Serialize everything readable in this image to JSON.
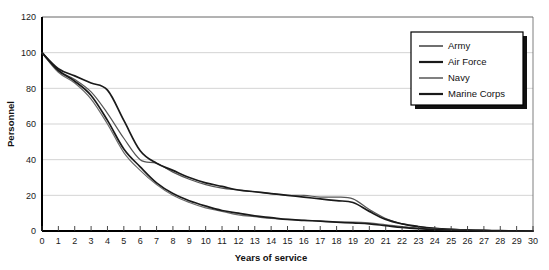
{
  "chart_data": {
    "type": "line",
    "title": "",
    "xlabel": "Years of service",
    "ylabel": "Personnel",
    "xlim": [
      0,
      30
    ],
    "ylim": [
      0,
      120
    ],
    "ytick_step": 20,
    "yticks": [
      0,
      20,
      40,
      60,
      80,
      100,
      120
    ],
    "xticks": [
      0,
      1,
      2,
      3,
      4,
      5,
      6,
      7,
      8,
      9,
      10,
      11,
      12,
      13,
      14,
      15,
      16,
      17,
      18,
      19,
      20,
      21,
      22,
      23,
      24,
      25,
      26,
      27,
      28,
      29,
      30
    ],
    "grid": true,
    "legend_position": "top-right",
    "x": [
      0,
      1,
      2,
      3,
      4,
      5,
      6,
      7,
      8,
      9,
      10,
      11,
      12,
      13,
      14,
      15,
      16,
      17,
      18,
      19,
      20,
      21,
      22,
      23,
      24,
      25,
      26,
      27,
      28,
      29,
      30
    ],
    "series": [
      {
        "name": "Army",
        "color": "#555555",
        "width": 1.2,
        "values": [
          100,
          90,
          85,
          78,
          66,
          52,
          40,
          38,
          33,
          29,
          26,
          24,
          23,
          22,
          21,
          20,
          20,
          19,
          19,
          18,
          12,
          7,
          4,
          2.5,
          1.5,
          1,
          0.6,
          0.4,
          0.2,
          0.1,
          0
        ]
      },
      {
        "name": "Air Force",
        "color": "#1a1a1a",
        "width": 1.7,
        "values": [
          100,
          91,
          87,
          83,
          79,
          62,
          45,
          38,
          34,
          30,
          27,
          25,
          23,
          22,
          21,
          20,
          19,
          18,
          17,
          16,
          11,
          6.5,
          4,
          2.5,
          1.5,
          0.9,
          0.5,
          0.3,
          0.2,
          0.1,
          0
        ]
      },
      {
        "name": "Navy",
        "color": "#6a6a6a",
        "width": 1.2,
        "values": [
          100,
          89,
          83,
          74,
          60,
          44,
          34,
          26,
          20,
          16,
          13,
          11,
          9,
          8,
          7,
          6.5,
          6,
          5.5,
          5,
          5,
          4.5,
          3.5,
          2.5,
          1.6,
          1,
          0.6,
          0.4,
          0.2,
          0.1,
          0.05,
          0
        ]
      },
      {
        "name": "Marine Corps",
        "color": "#1a1a1a",
        "width": 1.7,
        "values": [
          100,
          90,
          84,
          76,
          62,
          46,
          36,
          27,
          21,
          17,
          14,
          11.5,
          10,
          8.5,
          7.5,
          6.5,
          6,
          5.5,
          5,
          4.5,
          4,
          3,
          2,
          1.3,
          0.8,
          0.5,
          0.3,
          0.2,
          0.1,
          0.05,
          0
        ]
      }
    ]
  },
  "legend": {
    "items": [
      {
        "label": "Army"
      },
      {
        "label": "Air Force"
      },
      {
        "label": "Navy"
      },
      {
        "label": "Marine Corps"
      }
    ]
  },
  "colors": {
    "background": "#ffffff",
    "gridline": "#c8c8c8",
    "axis": "#000000",
    "text": "#111111"
  }
}
